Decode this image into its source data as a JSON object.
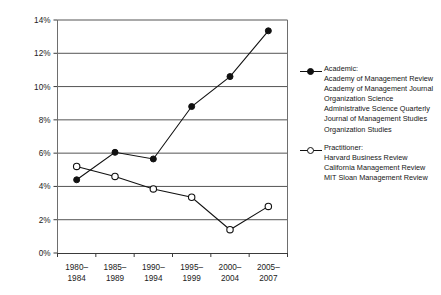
{
  "chart_data": {
    "type": "line",
    "title": "",
    "xlabel": "",
    "ylabel": "",
    "categories": [
      "1980–1984",
      "1985–1989",
      "1990–1994",
      "1995–1999",
      "2000–2004",
      "2005–2007"
    ],
    "category_lines": [
      [
        "1980–",
        "1984"
      ],
      [
        "1985–",
        "1989"
      ],
      [
        "1990–",
        "1994"
      ],
      [
        "1995–",
        "1999"
      ],
      [
        "2000–",
        "2004"
      ],
      [
        "2005–",
        "2007"
      ]
    ],
    "ylim": [
      0,
      14
    ],
    "ytick_values": [
      0,
      2,
      4,
      6,
      8,
      10,
      12,
      14
    ],
    "ytick_labels": [
      "0%",
      "2%",
      "4%",
      "6%",
      "8%",
      "10%",
      "12%",
      "14%"
    ],
    "grid": true,
    "legend_position": "right",
    "series": [
      {
        "name": "Academic",
        "marker": "filled-diamond",
        "color": "#111111",
        "values": [
          4.4,
          6.05,
          5.65,
          8.8,
          10.6,
          13.35
        ]
      },
      {
        "name": "Practitioner",
        "marker": "open-circle",
        "color": "#111111",
        "values": [
          5.2,
          4.6,
          3.85,
          3.35,
          1.4,
          2.8
        ]
      }
    ]
  },
  "legend": {
    "academic": {
      "marker_name": "filled-diamond-marker-icon",
      "heading": "Academic:",
      "journals": [
        "Academy of Management Review",
        "Academy of Management Journal",
        "Organization Science",
        "Administrative Science Quarterly",
        "Journal of Management Studies",
        "Organization Studies"
      ]
    },
    "practitioner": {
      "marker_name": "open-circle-marker-icon",
      "heading": "Practitioner:",
      "journals": [
        "Harvard Business Review",
        "California Management Review",
        "MIT Sloan Management Review"
      ]
    }
  }
}
